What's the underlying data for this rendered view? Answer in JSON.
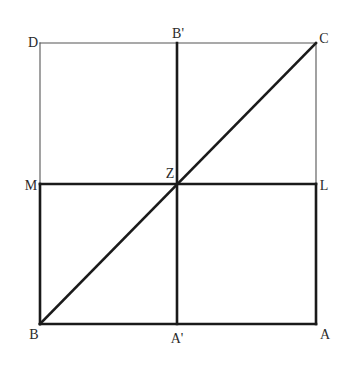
{
  "diagram": {
    "type": "geometric-figure",
    "colors": {
      "background": "#ffffff",
      "thin_line": "#555555",
      "thick_line": "#1a1a1a",
      "label": "#2a2a2a"
    },
    "points": {
      "D": {
        "label": "D",
        "x": 40,
        "y": 43
      },
      "B_prime": {
        "label": "B'",
        "x": 177,
        "y": 43
      },
      "C": {
        "label": "C",
        "x": 316,
        "y": 43
      },
      "M": {
        "label": "M",
        "x": 40,
        "y": 184
      },
      "Z": {
        "label": "Z",
        "x": 177,
        "y": 184
      },
      "L": {
        "label": "L",
        "x": 316,
        "y": 184
      },
      "B": {
        "label": "B",
        "x": 40,
        "y": 324
      },
      "A_prime": {
        "label": "A'",
        "x": 177,
        "y": 324
      },
      "A": {
        "label": "A",
        "x": 316,
        "y": 324
      }
    },
    "labels": [
      {
        "id": "D",
        "text": "D",
        "x": 33,
        "y": 47,
        "anchor": "middle"
      },
      {
        "id": "B_prime",
        "text": "B'",
        "x": 178,
        "y": 38,
        "anchor": "middle"
      },
      {
        "id": "C",
        "text": "C",
        "x": 324,
        "y": 43,
        "anchor": "middle"
      },
      {
        "id": "Z",
        "text": "Z",
        "x": 170,
        "y": 178,
        "anchor": "middle"
      },
      {
        "id": "M",
        "text": "M",
        "x": 31,
        "y": 190,
        "anchor": "middle"
      },
      {
        "id": "L",
        "text": "L",
        "x": 324,
        "y": 190,
        "anchor": "middle"
      },
      {
        "id": "B",
        "text": "B",
        "x": 34,
        "y": 339,
        "anchor": "middle"
      },
      {
        "id": "A_prime",
        "text": "A'",
        "x": 177,
        "y": 343,
        "anchor": "middle"
      },
      {
        "id": "A",
        "text": "A",
        "x": 325,
        "y": 339,
        "anchor": "middle"
      }
    ],
    "segments": [
      {
        "id": "DC",
        "from": "D",
        "to": "C",
        "weight": "thin"
      },
      {
        "id": "DM",
        "from": "D",
        "to": "M",
        "weight": "thin"
      },
      {
        "id": "CL",
        "from": "C",
        "to": "L",
        "weight": "thin"
      },
      {
        "id": "MB",
        "from": "M",
        "to": "B",
        "weight": "thick"
      },
      {
        "id": "LA",
        "from": "L",
        "to": "A",
        "weight": "thick"
      },
      {
        "id": "BA",
        "from": "B",
        "to": "A",
        "weight": "thick"
      },
      {
        "id": "ML",
        "from": "M",
        "to": "L",
        "weight": "thick"
      },
      {
        "id": "B_primeA_prime",
        "from": "B_prime",
        "to": "A_prime",
        "weight": "thick"
      },
      {
        "id": "BC",
        "from": "B",
        "to": "C",
        "weight": "thick"
      }
    ]
  }
}
